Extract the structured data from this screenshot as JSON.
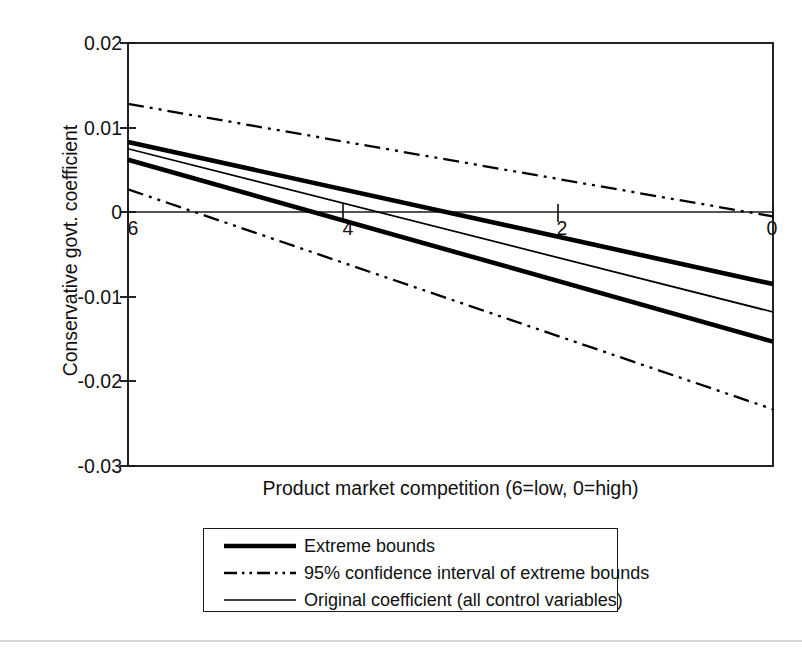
{
  "chart_data": {
    "type": "line",
    "title": "",
    "xlabel": "Product market competition (6=low, 0=high)",
    "ylabel": "Conservative govt. coefficient",
    "xlim": [
      6,
      0
    ],
    "ylim": [
      -0.03,
      0.02
    ],
    "x_ticks": [
      6,
      4,
      2,
      0
    ],
    "x_tick_labels": [
      "6",
      "4",
      "2",
      "0"
    ],
    "y_ticks": [
      0.02,
      0.01,
      0,
      -0.01,
      -0.02,
      -0.03
    ],
    "y_tick_labels": [
      "0.02",
      "0.01",
      "0",
      "-0.01",
      "-0.02",
      "-0.03"
    ],
    "x_axis_reversed": true,
    "grid": false,
    "zero_line": true,
    "legend_position": "below-plot",
    "series": [
      {
        "name": "Extreme bounds (upper)",
        "legend_label": "Extreme bounds",
        "style": "thick-solid",
        "color": "#000000",
        "x": [
          6,
          0
        ],
        "values": [
          0.0083,
          -0.0085
        ]
      },
      {
        "name": "Extreme bounds (lower)",
        "legend_label": "Extreme bounds",
        "style": "thick-solid",
        "color": "#000000",
        "x": [
          6,
          0
        ],
        "values": [
          0.0062,
          -0.0153
        ]
      },
      {
        "name": "95% confidence interval (upper)",
        "legend_label": "95% confidence interval of extreme bounds",
        "style": "dash-dot",
        "color": "#000000",
        "x": [
          6,
          0
        ],
        "values": [
          0.0128,
          -0.0005
        ]
      },
      {
        "name": "95% confidence interval (lower)",
        "legend_label": "95% confidence interval of extreme bounds",
        "style": "dash-dot",
        "color": "#000000",
        "x": [
          6,
          0
        ],
        "values": [
          0.0027,
          -0.0233
        ]
      },
      {
        "name": "Original coefficient (all control variables)",
        "legend_label": "Original coefficient (all control variables)",
        "style": "thin-solid",
        "color": "#000000",
        "x": [
          6,
          0
        ],
        "values": [
          0.0075,
          -0.0118
        ]
      }
    ]
  },
  "legend": {
    "items": [
      {
        "label": "Extreme bounds",
        "key": "thick-solid-line-key"
      },
      {
        "label": "95% confidence interval of extreme bounds",
        "key": "dash-dot-line-key"
      },
      {
        "label": "Original coefficient (all control variables)",
        "key": "thin-solid-line-key"
      }
    ]
  },
  "axes": {
    "y_title": "Conservative govt. coefficient",
    "x_title": "Product market competition (6=low, 0=high)",
    "y_labels": [
      "0.02",
      "0.01",
      "0",
      "-0.01",
      "-0.02",
      "-0.03"
    ],
    "x_labels": [
      "6",
      "4",
      "2",
      "0"
    ]
  }
}
